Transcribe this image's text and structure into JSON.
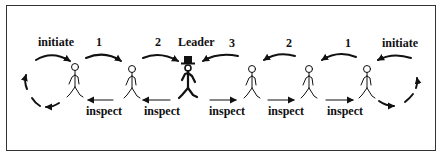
{
  "diagram": {
    "leader_label": "Leader",
    "top_labels": {
      "left_initiate": "initiate",
      "left_1": "1",
      "left_2": "2",
      "right_3": "3",
      "right_2": "2",
      "right_1": "1",
      "right_initiate": "initiate"
    },
    "inspect_labels": [
      "inspect",
      "inspect",
      "inspect",
      "inspect",
      "inspect",
      "inspect"
    ],
    "figures": [
      {
        "role": "agent",
        "x": 75
      },
      {
        "role": "agent",
        "x": 132
      },
      {
        "role": "leader",
        "x": 188
      },
      {
        "role": "agent",
        "x": 252
      },
      {
        "role": "agent",
        "x": 309
      },
      {
        "role": "agent",
        "x": 367
      }
    ],
    "colors": {
      "ink": "#111111",
      "frame": "#333333",
      "background": "#ffffff"
    }
  }
}
